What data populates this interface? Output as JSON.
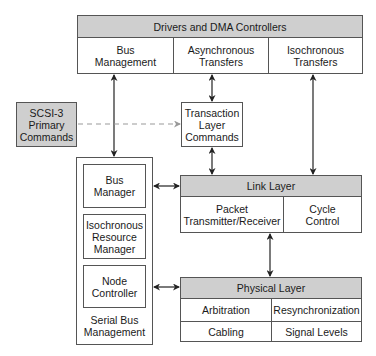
{
  "drivers": {
    "title": "Drivers and DMA Controllers",
    "columns": [
      "Bus\nManagement",
      "Asynchronous\nTransfers",
      "Isochronous\nTransfers"
    ]
  },
  "scsi": {
    "label": "SCSI-3\nPrimary\nCommands"
  },
  "transaction": {
    "label": "Transaction\nLayer\nCommands"
  },
  "serial_bus_management": {
    "caption": "Serial Bus\nManagement",
    "items": [
      "Bus\nManager",
      "Isochronous\nResource\nManager",
      "Node\nController"
    ]
  },
  "link_layer": {
    "title": "Link Layer",
    "cells": [
      "Packet\nTransmitter/Receiver",
      "Cycle\nControl"
    ]
  },
  "physical_layer": {
    "title": "Physical Layer",
    "cells": [
      "Arbitration",
      "Resynchronization",
      "Cabling",
      "Signal Levels"
    ]
  },
  "colors": {
    "shade": "#cfcfcf",
    "line": "#555555",
    "dashed": "#999999"
  }
}
